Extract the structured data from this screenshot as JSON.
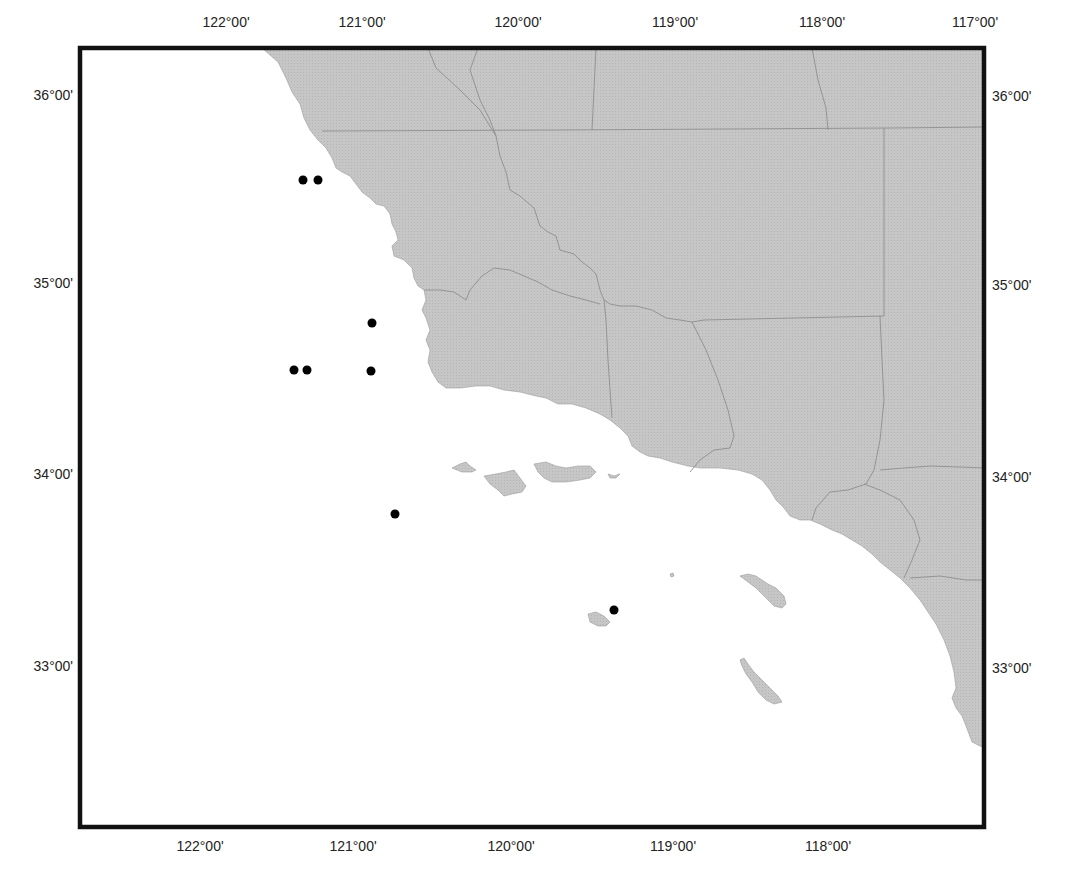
{
  "map": {
    "type": "point-distribution map",
    "region": "Southern California coast",
    "frame": {
      "x": 80,
      "y": 48,
      "width": 904,
      "height": 779
    },
    "colors": {
      "land": "#c4c4c4",
      "land_border": "#8e8e8e",
      "ocean": "#ffffff",
      "frame": "#111111",
      "points": "#000000"
    },
    "longitude_labels_top": [
      {
        "label": "122°00'",
        "x": 226
      },
      {
        "label": "121°00'",
        "x": 362
      },
      {
        "label": "120°00'",
        "x": 518
      },
      {
        "label": "119°00'",
        "x": 675
      },
      {
        "label": "118°00'",
        "x": 822
      },
      {
        "label": "117°00'",
        "x": 975
      }
    ],
    "longitude_labels_bottom": [
      {
        "label": "122°00'",
        "x": 200
      },
      {
        "label": "121°00'",
        "x": 353
      },
      {
        "label": "120°00'",
        "x": 511
      },
      {
        "label": "119°00'",
        "x": 673
      },
      {
        "label": "118°00'",
        "x": 828
      }
    ],
    "latitude_labels_left": [
      {
        "label": "36°00'",
        "y": 95
      },
      {
        "label": "35°00'",
        "y": 283
      },
      {
        "label": "34°00'",
        "y": 474
      },
      {
        "label": "33°00'",
        "y": 666
      }
    ],
    "latitude_labels_right": [
      {
        "label": "36°00'",
        "y": 96
      },
      {
        "label": "35°00'",
        "y": 285
      },
      {
        "label": "34°00'",
        "y": 477
      },
      {
        "label": "33°00'",
        "y": 668
      }
    ],
    "points": [
      {
        "x": 303,
        "y": 180
      },
      {
        "x": 318,
        "y": 180
      },
      {
        "x": 372,
        "y": 323
      },
      {
        "x": 294,
        "y": 370
      },
      {
        "x": 307,
        "y": 370
      },
      {
        "x": 371,
        "y": 371
      },
      {
        "x": 395,
        "y": 514
      },
      {
        "x": 614,
        "y": 610
      }
    ]
  }
}
